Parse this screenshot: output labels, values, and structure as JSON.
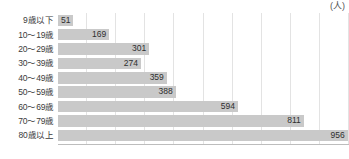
{
  "chart_data": {
    "type": "bar",
    "orientation": "horizontal",
    "title": "",
    "subtitle": "",
    "unit_label": "(人)",
    "xlabel": "",
    "ylabel": "",
    "categories": [
      "9歳以下",
      "10〜19歳",
      "20〜29歳",
      "30〜39歳",
      "40〜49歳",
      "50〜59歳",
      "60〜69歳",
      "70〜79歳",
      "80歳以上"
    ],
    "values": [
      51,
      169,
      301,
      274,
      359,
      388,
      594,
      811,
      956
    ],
    "value_labels": [
      "51",
      "169",
      "301",
      "274",
      "359",
      "388",
      "594",
      "811",
      "956"
    ],
    "xlim": [
      0,
      960
    ],
    "gridline_values": [
      96,
      192,
      288,
      384,
      480,
      576,
      672,
      768,
      864,
      960
    ],
    "grid": true,
    "legend": false,
    "bar_color": "#c9c9c9",
    "grid_color": "#e3e3e3",
    "axis_color": "#bdbdbd",
    "text_color": "#3b3b3b"
  }
}
